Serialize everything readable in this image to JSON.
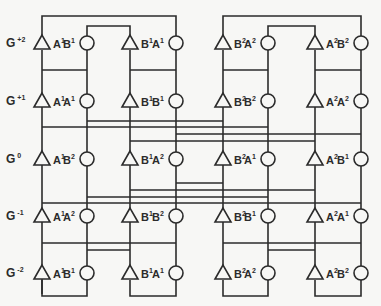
{
  "diagram": {
    "title": "",
    "generations": [
      {
        "label": "G",
        "sup": "+2",
        "y": 43,
        "nodes": [
          [
            "A",
            "1"
          ],
          [
            "B",
            "1"
          ],
          [
            "B",
            "1"
          ],
          [
            "A",
            "1"
          ],
          [
            "B",
            "2"
          ],
          [
            "A",
            "2"
          ],
          [
            "A",
            "2"
          ],
          [
            "B",
            "2"
          ]
        ]
      },
      {
        "label": "G",
        "sup": "+1",
        "y": 101,
        "nodes": [
          [
            "A",
            "1"
          ],
          [
            "A",
            "1"
          ],
          [
            "B",
            "1"
          ],
          [
            "B",
            "1"
          ],
          [
            "B",
            "2"
          ],
          [
            "B",
            "2"
          ],
          [
            "A",
            "2"
          ],
          [
            "A",
            "2"
          ]
        ]
      },
      {
        "label": "G",
        "sup": "0",
        "y": 159,
        "nodes": [
          [
            "A",
            "1"
          ],
          [
            "B",
            "2"
          ],
          [
            "B",
            "1"
          ],
          [
            "A",
            "2"
          ],
          [
            "B",
            "2"
          ],
          [
            "A",
            "1"
          ],
          [
            "A",
            "2"
          ],
          [
            "B",
            "1"
          ]
        ]
      },
      {
        "label": "G",
        "sup": "-1",
        "y": 216,
        "nodes": [
          [
            "A",
            "1"
          ],
          [
            "A",
            "2"
          ],
          [
            "B",
            "1"
          ],
          [
            "B",
            "2"
          ],
          [
            "B",
            "2"
          ],
          [
            "B",
            "1"
          ],
          [
            "A",
            "2"
          ],
          [
            "A",
            "1"
          ]
        ]
      },
      {
        "label": "G",
        "sup": "-2",
        "y": 273,
        "nodes": [
          [
            "A",
            "1"
          ],
          [
            "B",
            "1"
          ],
          [
            "B",
            "1"
          ],
          [
            "A",
            "1"
          ],
          [
            "B",
            "2"
          ],
          [
            "A",
            "2"
          ],
          [
            "A",
            "2"
          ],
          [
            "B",
            "2"
          ]
        ]
      }
    ],
    "columns": [
      {
        "x": 42,
        "symbol": "triangle",
        "sex": "male"
      },
      {
        "x": 87,
        "symbol": "circle",
        "sex": "female"
      },
      {
        "x": 130,
        "symbol": "triangle",
        "sex": "male"
      },
      {
        "x": 176,
        "symbol": "circle",
        "sex": "female"
      },
      {
        "x": 223,
        "symbol": "triangle",
        "sex": "male"
      },
      {
        "x": 268,
        "symbol": "circle",
        "sex": "female"
      },
      {
        "x": 315,
        "symbol": "triangle",
        "sex": "male"
      },
      {
        "x": 361,
        "symbol": "circle",
        "sex": "female"
      }
    ],
    "legend": {
      "triangle": "male",
      "circle": "female"
    },
    "colors": {
      "ink": "#2b2b2b",
      "paper": "#f7f7f5"
    }
  }
}
